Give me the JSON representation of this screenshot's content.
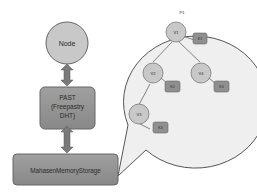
{
  "diagram": {
    "node": {
      "label": "Node"
    },
    "past": {
      "line1": "PAST",
      "line2": "(Freepastry",
      "line3": "DHT)"
    },
    "storage": {
      "label": "MahasenMemoryStorage"
    },
    "callout": {
      "title": "P1",
      "tree": [
        {
          "id": "v1",
          "label": "V1",
          "key": "K1"
        },
        {
          "id": "v2",
          "label": "V2",
          "key": "K2"
        },
        {
          "id": "v4",
          "label": "V4",
          "key": "K4"
        },
        {
          "id": "v3",
          "label": "V3",
          "key": "K3"
        }
      ]
    },
    "colors": {
      "circle_fill": "#c8c8c8",
      "box_fill": "#8f8f8f",
      "arrow_fill": "#7a7a7a",
      "callout_fill": "#efefef",
      "stroke": "#555555"
    }
  }
}
